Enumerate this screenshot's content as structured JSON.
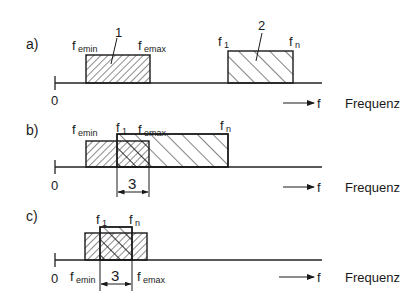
{
  "diagram": {
    "type": "frequency-band-overlap",
    "axis_label": "Frequenz",
    "axis_symbol": "f",
    "origin_label": "0",
    "colors": {
      "ink": "#1a1a1a",
      "background": "#ffffff"
    },
    "panels": [
      {
        "id": "a",
        "label": "a)",
        "band1": {
          "number": "1",
          "left_label": "f",
          "left_sub": "emin",
          "right_label": "f",
          "right_sub": "emax"
        },
        "band2": {
          "number": "2",
          "left_label": "f",
          "left_sub": "1",
          "right_label": "f",
          "right_sub": "n"
        },
        "overlap_label": ""
      },
      {
        "id": "b",
        "label": "b)",
        "band1": {
          "left_label": "f",
          "left_sub": "emin",
          "right_label": "f",
          "right_sub": "emax"
        },
        "band2": {
          "left_label": "f",
          "left_sub": "1",
          "right_label": "f",
          "right_sub": "n"
        },
        "overlap_label": "3"
      },
      {
        "id": "c",
        "label": "c)",
        "band1": {
          "left_label": "f",
          "left_sub": "emin",
          "right_label": "f",
          "right_sub": "emax"
        },
        "band2": {
          "left_label": "f",
          "left_sub": "1",
          "right_label": "f",
          "right_sub": "n"
        },
        "overlap_label": "3"
      }
    ]
  }
}
